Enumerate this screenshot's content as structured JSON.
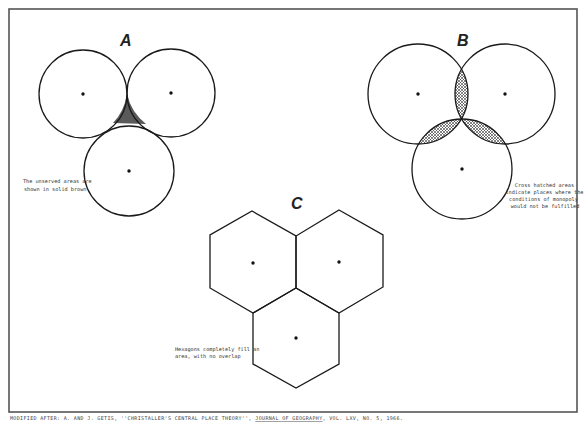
{
  "figure": {
    "border": {
      "x": 9,
      "y": 9,
      "width": 568,
      "height": 403,
      "color": "#555555"
    },
    "citation": {
      "prefix": "MODIFIED AFTER: A. AND J. GETIS, ''CHRISTALLER'S CENTRAL PLACE THEORY'', ",
      "journal": "JOURNAL OF GEOGRAPHY",
      "suffix": ", VOL. LXV, NO. 5, 1966."
    }
  },
  "panels": {
    "a": {
      "label": "A",
      "note_lines": [
        "The unserved areas are",
        "shown in solid brown"
      ],
      "shading_color": "#555555",
      "circles": [
        {
          "cx": 83,
          "cy": 94,
          "r": 44
        },
        {
          "cx": 171,
          "cy": 93,
          "r": 44
        },
        {
          "cx": 129,
          "cy": 171,
          "r": 45
        }
      ]
    },
    "b": {
      "label": "B",
      "note_lines": [
        "Cross hatched areas",
        "indicate places where the",
        "conditions of monopoly",
        "would not be fulfilled"
      ],
      "circles": [
        {
          "cx": 418,
          "cy": 94,
          "r": 50
        },
        {
          "cx": 505,
          "cy": 94,
          "r": 50
        },
        {
          "cx": 462,
          "cy": 169,
          "r": 50
        }
      ]
    },
    "c": {
      "label": "C",
      "note_lines": [
        "Hexagons completely fill an",
        "area, with no overlap"
      ],
      "hexagons": [
        {
          "cx": 253,
          "cy": 263
        },
        {
          "cx": 339,
          "cy": 262
        },
        {
          "cx": 296,
          "cy": 338
        }
      ]
    }
  }
}
